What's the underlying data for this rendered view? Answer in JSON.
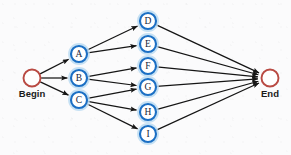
{
  "diagram": {
    "type": "directed-graph",
    "width": 291,
    "height": 155,
    "background_color": "#fbfbfc",
    "colors": {
      "edge": "#151515",
      "node_ring": "#1b6fc4",
      "node_halo": "#bcdcf2",
      "terminal_ring": "#b94a43",
      "node_fill": "#ffffff",
      "letter": "#14243a",
      "label": "#1a1a1a"
    },
    "terminals": {
      "begin": {
        "id": "Begin",
        "label": "Begin",
        "x": 32,
        "y": 78,
        "r": 8.5
      },
      "end": {
        "id": "End",
        "label": "End",
        "x": 270,
        "y": 78,
        "r": 8.5
      }
    },
    "nodes": [
      {
        "id": "A",
        "label": "A",
        "x": 79,
        "y": 54,
        "r": 8
      },
      {
        "id": "B",
        "label": "B",
        "x": 79,
        "y": 78,
        "r": 8
      },
      {
        "id": "C",
        "label": "C",
        "x": 79,
        "y": 100,
        "r": 8
      },
      {
        "id": "D",
        "label": "D",
        "x": 148,
        "y": 21,
        "r": 8
      },
      {
        "id": "E",
        "label": "E",
        "x": 148,
        "y": 44,
        "r": 8
      },
      {
        "id": "F",
        "label": "F",
        "x": 148,
        "y": 66,
        "r": 8
      },
      {
        "id": "G",
        "label": "G",
        "x": 148,
        "y": 87,
        "r": 8
      },
      {
        "id": "H",
        "label": "H",
        "x": 148,
        "y": 112,
        "r": 8
      },
      {
        "id": "I",
        "label": "I",
        "x": 148,
        "y": 134,
        "r": 8
      }
    ],
    "edges": [
      {
        "from": "Begin",
        "to": "A"
      },
      {
        "from": "Begin",
        "to": "B"
      },
      {
        "from": "Begin",
        "to": "C"
      },
      {
        "from": "A",
        "to": "D"
      },
      {
        "from": "A",
        "to": "E"
      },
      {
        "from": "B",
        "to": "F"
      },
      {
        "from": "B",
        "to": "G"
      },
      {
        "from": "C",
        "to": "G"
      },
      {
        "from": "C",
        "to": "H"
      },
      {
        "from": "C",
        "to": "I"
      },
      {
        "from": "D",
        "to": "End"
      },
      {
        "from": "E",
        "to": "End"
      },
      {
        "from": "F",
        "to": "End"
      },
      {
        "from": "G",
        "to": "End"
      },
      {
        "from": "H",
        "to": "End"
      },
      {
        "from": "I",
        "to": "End"
      }
    ]
  }
}
